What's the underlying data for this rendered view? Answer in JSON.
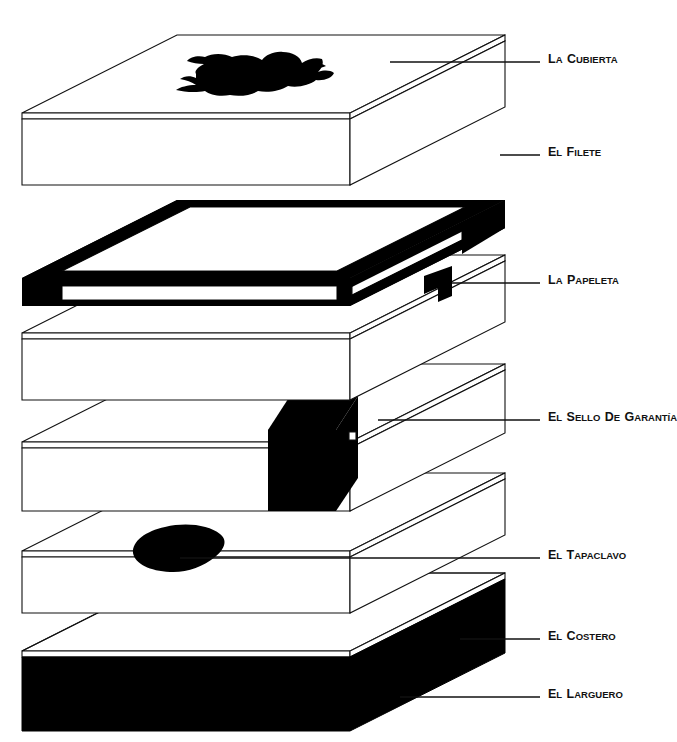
{
  "figure": {
    "type": "exploded-isometric-assembly-diagram",
    "title_visible": false,
    "background_color": "#ffffff",
    "line_color": "#111111",
    "fill_black": "#000000",
    "language": "es"
  },
  "callouts": [
    {
      "id": "la-cubierta",
      "label": "La Cubierta",
      "label_x": 548,
      "label_y": 57,
      "leader_x1": 390,
      "leader_x2": 540,
      "leader_y": 62,
      "target": "top-slab-upper-face"
    },
    {
      "id": "el-filete",
      "label": "El Filete",
      "label_x": 548,
      "label_y": 150,
      "leader_x1": 500,
      "leader_x2": 540,
      "leader_y": 155,
      "target": "black-open-frame"
    },
    {
      "id": "la-papeleta",
      "label": "La Papeleta",
      "label_x": 548,
      "label_y": 278,
      "leader_x1": 452,
      "leader_x2": 540,
      "leader_y": 283,
      "target": "small-black-tab"
    },
    {
      "id": "el-sello-de-garantia",
      "label": "El Sello de Garantía",
      "label_parts": [
        "El",
        "Sello",
        "de",
        "Garantía"
      ],
      "label_x": 548,
      "label_y": 415,
      "leader_x1": 378,
      "leader_x2": 540,
      "leader_y": 420,
      "target": "black-corner-block"
    },
    {
      "id": "el-tapaclavo",
      "label": "El Tapaclavo",
      "label_x": 548,
      "label_y": 553,
      "leader_x1": 180,
      "leader_x2": 540,
      "leader_y": 558,
      "target": "black-teardrop-blob"
    },
    {
      "id": "el-costero",
      "label": "El Costero",
      "label_x": 548,
      "label_y": 634,
      "leader_x1": 460,
      "leader_x2": 540,
      "leader_y": 639,
      "target": "bottom-slab-top-edge-band"
    },
    {
      "id": "el-larguero",
      "label": "El Larguero",
      "label_x": 548,
      "label_y": 692,
      "leader_x1": 400,
      "leader_x2": 540,
      "leader_y": 697,
      "target": "bottom-slab-black-side-face"
    }
  ],
  "parts": [
    {
      "id": "slab-1",
      "name": "La Cubierta slab",
      "order": 1,
      "top_face_fill": "white",
      "side_face_fill": "white",
      "has_ink_blot": true,
      "ink_blot_name": "irregular-black-brush-blot"
    },
    {
      "id": "frame-2",
      "name": "El Filete open frame",
      "order": 2,
      "top_face_fill": "black",
      "side_face_fill": "black",
      "hollow": true
    },
    {
      "id": "slab-3",
      "name": "La Papeleta slab",
      "order": 3,
      "top_face_fill": "white",
      "side_face_fill": "white",
      "has_tab": true,
      "tab_name": "small-black-tab"
    },
    {
      "id": "slab-4",
      "name": "El Sello de Garantía slab",
      "order": 4,
      "top_face_fill": "white",
      "side_face_fill": "white",
      "has_corner_block": true,
      "corner_block_name": "black-corner-block"
    },
    {
      "id": "slab-5",
      "name": "El Tapaclavo slab",
      "order": 5,
      "top_face_fill": "white",
      "side_face_fill": "white",
      "has_blob": true,
      "blob_name": "black-teardrop-blob"
    },
    {
      "id": "slab-6",
      "name": "El Costero / El Larguero base slab",
      "order": 6,
      "top_face_fill": "white",
      "side_face_fill": "black"
    }
  ]
}
